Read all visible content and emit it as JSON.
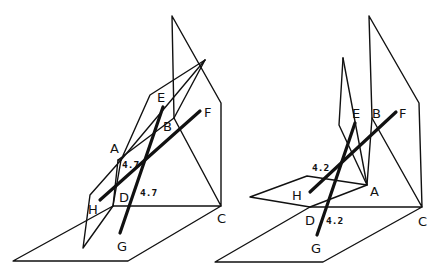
{
  "figures": [
    {
      "id": "left",
      "labels": {
        "A": "A",
        "B": "B",
        "C": "C",
        "D": "D",
        "E": "E",
        "F": "F",
        "G": "G",
        "H": "H"
      },
      "measurements": [
        "4.7",
        "4.7"
      ]
    },
    {
      "id": "right",
      "labels": {
        "A": "A",
        "B": "B",
        "C": "C",
        "D": "D",
        "E": "E",
        "F": "F",
        "G": "G",
        "H": "H"
      },
      "measurements": [
        "4.2",
        "4.2"
      ]
    }
  ]
}
